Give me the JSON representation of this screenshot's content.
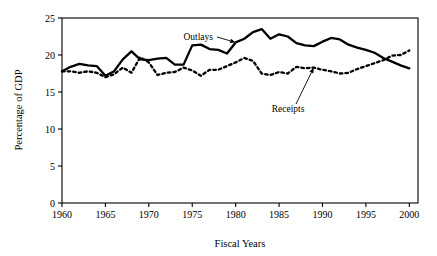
{
  "chart_data": {
    "type": "line",
    "title": "",
    "xlabel": "Fiscal Years",
    "ylabel": "Percentage of GDP",
    "xlim": [
      1960,
      2001
    ],
    "ylim": [
      0,
      25
    ],
    "xticks": [
      1960,
      1965,
      1970,
      1975,
      1980,
      1985,
      1990,
      1995,
      2000
    ],
    "yticks": [
      0,
      5,
      10,
      15,
      20,
      25
    ],
    "xtick_labels": [
      "1960",
      "1965",
      "1970",
      "1975",
      "1980",
      "1985",
      "1990",
      "1995",
      "2000"
    ],
    "ytick_labels": [
      "0",
      "5",
      "10",
      "15",
      "20",
      "25"
    ],
    "grid": false,
    "legend_position": "inline-annotations",
    "x": [
      1960,
      1961,
      1962,
      1963,
      1964,
      1965,
      1966,
      1967,
      1968,
      1969,
      1970,
      1971,
      1972,
      1973,
      1974,
      1975,
      1976,
      1977,
      1978,
      1979,
      1980,
      1981,
      1982,
      1983,
      1984,
      1985,
      1986,
      1987,
      1988,
      1989,
      1990,
      1991,
      1992,
      1993,
      1994,
      1995,
      1996,
      1997,
      1998,
      1999,
      2000
    ],
    "series": [
      {
        "name": "Outlays",
        "style": "solid",
        "color": "#000000",
        "values": [
          17.8,
          18.4,
          18.8,
          18.6,
          18.5,
          17.2,
          17.8,
          19.4,
          20.5,
          19.4,
          19.3,
          19.5,
          19.6,
          18.7,
          18.7,
          21.3,
          21.4,
          20.8,
          20.7,
          20.2,
          21.7,
          22.2,
          23.1,
          23.5,
          22.2,
          22.8,
          22.5,
          21.6,
          21.3,
          21.2,
          21.8,
          22.3,
          22.1,
          21.4,
          21.0,
          20.7,
          20.3,
          19.6,
          19.1,
          18.6,
          18.2
        ]
      },
      {
        "name": "Receipts",
        "style": "dotted",
        "color": "#000000",
        "values": [
          17.8,
          17.8,
          17.6,
          17.8,
          17.6,
          17.0,
          17.4,
          18.3,
          17.6,
          19.7,
          19.0,
          17.3,
          17.6,
          17.7,
          18.3,
          17.9,
          17.2,
          18.0,
          18.0,
          18.5,
          19.0,
          19.6,
          19.2,
          17.5,
          17.3,
          17.7,
          17.5,
          18.4,
          18.2,
          18.3,
          18.0,
          17.8,
          17.5,
          17.6,
          18.1,
          18.5,
          18.9,
          19.3,
          19.9,
          20.0,
          20.6
        ]
      }
    ],
    "annotations": [
      {
        "text": "Outlays",
        "points_to_series": "Outlays",
        "points_to_year": 1980
      },
      {
        "text": "Receipts",
        "points_to_series": "Receipts",
        "points_to_year": 1989
      }
    ]
  }
}
